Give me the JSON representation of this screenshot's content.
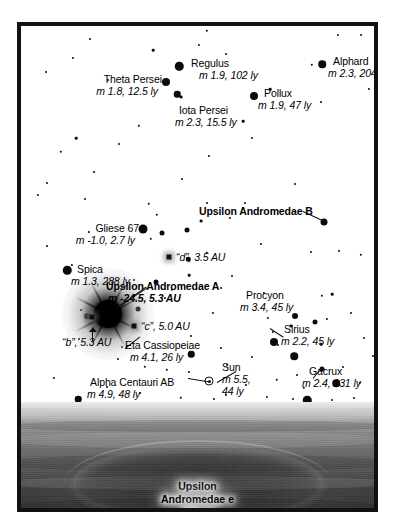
{
  "diagram": {
    "frame_color": "#111111"
  },
  "objects": [
    {
      "name": "Regulus",
      "detail": "m 1.9, 102 ly",
      "id": "regulus"
    },
    {
      "name": "Alphard",
      "detail": "m 2.3, 204 ly",
      "id": "alphard"
    },
    {
      "name": "Theta Persei",
      "detail": "m 1.8, 12.5 ly",
      "id": "theta-persei"
    },
    {
      "name": "Pollux",
      "detail": "m 1.9, 47 ly",
      "id": "pollux"
    },
    {
      "name": "Iota Persei",
      "detail": "m 2.3, 15.5 ly",
      "id": "iota-persei"
    },
    {
      "name": "Upsilon Andromedae B",
      "detail": "",
      "id": "upsilon-andromedae-b"
    },
    {
      "name": "Gliese 67",
      "detail": "m -1.0, 2.7 ly",
      "id": "gliese-67"
    },
    {
      "name": "“d”",
      "detail": "3.5 AU",
      "id": "planet-d"
    },
    {
      "name": "Spica",
      "detail": "m 1.3, 288 ly",
      "id": "spica"
    },
    {
      "name": "Upsilon Andromedae A",
      "detail": "m -24.5, 5.3 AU",
      "id": "upsilon-andromedae-a"
    },
    {
      "name": "“c”",
      "detail": "5.0 AU",
      "id": "planet-c"
    },
    {
      "name": "“b”",
      "detail": "5.3 AU",
      "id": "planet-b"
    },
    {
      "name": "Procyon",
      "detail": "m 3.4, 45 ly",
      "id": "procyon"
    },
    {
      "name": "Sirius",
      "detail": "m 2.2, 45 ly",
      "id": "sirius"
    },
    {
      "name": "Eta Cassiopeiae",
      "detail": "m 4.1, 26 ly",
      "id": "eta-cassiopeiae"
    },
    {
      "name": "Gacrux",
      "detail": "m 2.4, 131 ly",
      "id": "gacrux"
    },
    {
      "name": "Sun",
      "detail": "m 5.5, 44 ly",
      "id": "sun"
    },
    {
      "name": "Alpha Centauri AB",
      "detail": "m 4.9, 48 ly",
      "id": "alpha-centauri-ab"
    }
  ],
  "labels": {
    "regulus_name": "Regulus",
    "regulus_detail": "m 1.9, 102 ly",
    "alphard_name": "Alphard",
    "alphard_detail": "m 2.3, 204 ly",
    "theta_persei_name": "Theta Persei",
    "theta_persei_detail": "m 1.8, 12.5 ly",
    "pollux_name": "Pollux",
    "pollux_detail": "m 1.9, 47 ly",
    "iota_persei_name": "Iota Persei",
    "iota_persei_detail": "m 2.3, 15.5 ly",
    "upsilon_b_name": "Upsilon Andromedae B",
    "gliese_name": "Gliese 67",
    "gliese_detail": "m -1.0, 2.7 ly",
    "planet_d": "“d”, 3.5 AU",
    "spica_name": "Spica",
    "spica_detail": "m 1.3, 288 ly",
    "upsilon_a_name": "Upsilon Andromedae A",
    "upsilon_a_detail": "m -24.5, 5.3 AU",
    "planet_c": "“c”, 5.0 AU",
    "planet_b": "“b”, 5.3 AU",
    "procyon_name": "Procyon",
    "procyon_detail": "m 3.4, 45 ly",
    "sirius_name": "Sirius",
    "sirius_detail": "m 2.2, 45 ly",
    "eta_cas_name": "Eta Cassiopeiae",
    "eta_cas_detail": "m 4.1, 26 ly",
    "gacrux_name": "Gacrux",
    "gacrux_detail": "m 2.4, 131 ly",
    "sun_name": "Sun",
    "sun_detail_1": "m 5.5,",
    "sun_detail_2": "44 ly",
    "alpha_cen_name": "Alpha Centauri AB",
    "alpha_cen_detail": "m 4.9, 48 ly",
    "planet_surface_name_1": "Upsilon",
    "planet_surface_name_2": "Andromedae e",
    "planet_surface_size": "300 mi"
  },
  "starfield": [
    [
      69,
      13,
      2.0
    ],
    [
      186,
      5,
      2.4
    ],
    [
      132,
      24,
      2.6
    ],
    [
      160,
      71,
      2.8
    ],
    [
      52,
      32,
      2.2
    ],
    [
      25,
      46,
      2.0
    ],
    [
      118,
      100,
      2.4
    ],
    [
      40,
      126,
      2.4
    ],
    [
      26,
      157,
      2.0
    ],
    [
      87,
      54,
      1.9
    ],
    [
      205,
      28,
      2.0
    ],
    [
      291,
      39,
      2.4
    ],
    [
      249,
      63,
      2.6
    ],
    [
      300,
      76,
      2.0
    ],
    [
      222,
      95,
      2.6
    ],
    [
      231,
      112,
      2.2
    ],
    [
      348,
      63,
      2.2
    ],
    [
      356,
      105,
      2.0
    ],
    [
      188,
      130,
      2.2
    ],
    [
      55,
      112,
      2.6
    ],
    [
      98,
      118,
      2.2
    ],
    [
      73,
      146,
      2.0
    ],
    [
      161,
      153,
      2.0
    ],
    [
      178,
      19,
      2.2
    ],
    [
      340,
      9,
      2.0
    ],
    [
      17,
      169,
      2.2
    ],
    [
      128,
      178,
      2.4
    ],
    [
      274,
      158,
      2.0
    ],
    [
      317,
      9,
      2.2
    ],
    [
      64,
      173,
      2.0
    ],
    [
      136,
      189,
      2.4
    ],
    [
      180,
      195,
      2.8
    ],
    [
      209,
      192,
      2.2
    ],
    [
      224,
      177,
      2.0
    ],
    [
      240,
      218,
      2.2
    ],
    [
      186,
      227,
      2.4
    ],
    [
      168,
      249,
      2.6
    ],
    [
      113,
      254,
      2.0
    ],
    [
      290,
      226,
      2.2
    ],
    [
      318,
      225,
      2.0
    ],
    [
      68,
      206,
      2.2
    ],
    [
      26,
      220,
      2.0
    ],
    [
      340,
      229,
      2.4
    ],
    [
      355,
      222,
      2.0
    ],
    [
      200,
      262,
      2.0
    ],
    [
      151,
      264,
      2.4
    ],
    [
      243,
      267,
      2.2
    ],
    [
      301,
      270,
      2.4
    ],
    [
      311,
      268,
      2.6
    ],
    [
      192,
      287,
      2.2
    ],
    [
      330,
      287,
      2.0
    ],
    [
      306,
      293,
      2.2
    ],
    [
      60,
      284,
      2.0
    ],
    [
      144,
      272,
      2.2
    ],
    [
      97,
      333,
      2.2
    ],
    [
      124,
      341,
      2.4
    ],
    [
      146,
      344,
      2.4
    ],
    [
      168,
      346,
      2.2
    ],
    [
      200,
      322,
      2.2
    ],
    [
      206,
      339,
      2.0
    ],
    [
      101,
      321,
      2.0
    ],
    [
      58,
      313,
      2.0
    ],
    [
      231,
      331,
      2.2
    ],
    [
      247,
      292,
      2.2
    ],
    [
      270,
      300,
      2.8
    ],
    [
      225,
      359,
      2.0
    ],
    [
      252,
      306,
      2.2
    ],
    [
      257,
      319,
      2.0
    ],
    [
      256,
      354,
      2.4
    ],
    [
      276,
      349,
      2.0
    ],
    [
      283,
      362,
      2.4
    ],
    [
      160,
      372,
      2.4
    ],
    [
      119,
      367,
      2.0
    ],
    [
      205,
      369,
      2.0
    ],
    [
      193,
      373,
      2.2
    ],
    [
      300,
      318,
      2.6
    ],
    [
      322,
      341,
      2.0
    ],
    [
      339,
      357,
      2.4
    ],
    [
      352,
      330,
      2.2
    ],
    [
      356,
      366,
      2.0
    ],
    [
      333,
      372,
      2.2
    ],
    [
      311,
      374,
      2.0
    ],
    [
      362,
      295,
      2.0
    ],
    [
      246,
      371,
      2.2
    ],
    [
      86,
      361,
      2.0
    ],
    [
      33,
      352,
      2.2
    ],
    [
      170,
      310,
      2.0
    ],
    [
      96,
      300,
      2.0
    ],
    [
      186,
      177,
      2.0
    ],
    [
      211,
      250,
      2.0
    ],
    [
      130,
      213,
      2.4
    ],
    [
      51,
      239,
      2.2
    ],
    [
      272,
      373,
      2.0
    ],
    [
      289,
      376,
      2.2
    ],
    [
      347,
      378,
      2.0
    ],
    [
      213,
      380,
      2.4
    ],
    [
      160,
      385,
      2.2
    ],
    [
      238,
      386,
      2.0
    ],
    [
      315,
      386,
      2.4
    ],
    [
      355,
      388,
      2.0
    ],
    [
      268,
      386,
      2.2
    ],
    [
      296,
      380,
      2.0
    ],
    [
      343,
      312,
      2.0
    ],
    [
      364,
      338,
      2.2
    ]
  ],
  "big_stars": [
    [
      158,
      40,
      8.5
    ],
    [
      301,
      38,
      7.5
    ],
    [
      145,
      56,
      8.0
    ],
    [
      233,
      70,
      8.0
    ],
    [
      156,
      68,
      6.5
    ],
    [
      303,
      196,
      7.0
    ],
    [
      122,
      203,
      9.0
    ],
    [
      46,
      244,
      8.5
    ],
    [
      253,
      316,
      8.0
    ],
    [
      273,
      330,
      7.5
    ],
    [
      286,
      374,
      8.5
    ],
    [
      274,
      290,
      6.0
    ],
    [
      170,
      328,
      6.5
    ],
    [
      315,
      357,
      7.5
    ],
    [
      57,
      373,
      6.5
    ]
  ],
  "medium_stars": [
    [
      141,
      207,
      5.0
    ],
    [
      166,
      204,
      5.0
    ],
    [
      66,
      290,
      5.5
    ],
    [
      117,
      283,
      5.0
    ],
    [
      135,
      256,
      5.0
    ],
    [
      167,
      233,
      4.5
    ],
    [
      294,
      296,
      5.0
    ],
    [
      301,
      343,
      5.0
    ]
  ]
}
